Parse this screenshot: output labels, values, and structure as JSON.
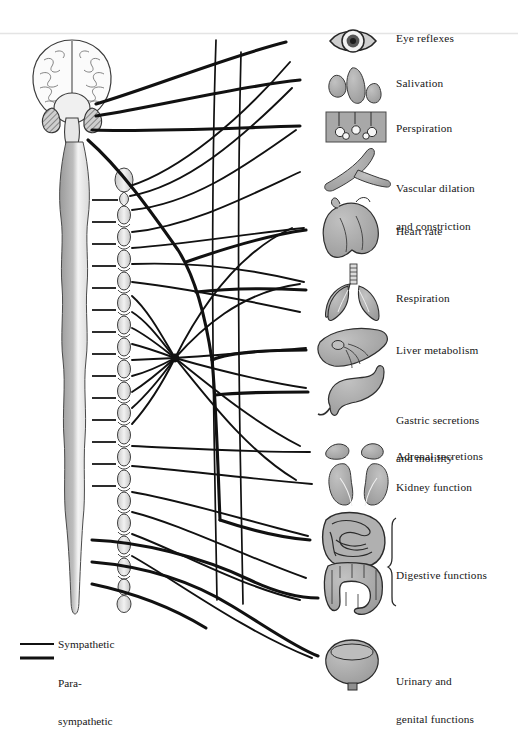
{
  "figure": {
    "type": "anatomical-diagram",
    "background_color": "#ffffff",
    "ink_color": "#1a1a1a",
    "organ_fill": "#a6a6a6",
    "top_rule_color": "#e2e2e2"
  },
  "labels": [
    {
      "id": "eye",
      "text": "Eye reflexes",
      "x": 396,
      "y": 32,
      "lines": [
        "Eye reflexes"
      ]
    },
    {
      "id": "saliva",
      "text": "Salivation",
      "x": 396,
      "y": 77,
      "lines": [
        "Salivation"
      ]
    },
    {
      "id": "perspire",
      "text": "Perspiration",
      "x": 396,
      "y": 122,
      "lines": [
        "Perspiration"
      ]
    },
    {
      "id": "vascular",
      "text": "Vascular dilation and constriction",
      "x": 396,
      "y": 157,
      "lines": [
        "Vascular dilation",
        "and constriction"
      ]
    },
    {
      "id": "heart",
      "text": "Heart rate",
      "x": 396,
      "y": 225,
      "lines": [
        "Heart rate"
      ]
    },
    {
      "id": "respire",
      "text": "Respiration",
      "x": 396,
      "y": 292,
      "lines": [
        "Respiration"
      ]
    },
    {
      "id": "liver",
      "text": "Liver metabolism",
      "x": 396,
      "y": 344,
      "lines": [
        "Liver metabolism"
      ]
    },
    {
      "id": "gastric",
      "text": "Gastric secretions and motility",
      "x": 396,
      "y": 389,
      "lines": [
        "Gastric secretions",
        "and motility"
      ]
    },
    {
      "id": "adrenal",
      "text": "Adrenal secretions",
      "x": 396,
      "y": 450,
      "lines": [
        "Adrenal secretions"
      ]
    },
    {
      "id": "kidney",
      "text": "Kidney function",
      "x": 396,
      "y": 481,
      "lines": [
        "Kidney function"
      ]
    },
    {
      "id": "digestive",
      "text": "Digestive functions",
      "x": 396,
      "y": 569,
      "lines": [
        "Digestive functions"
      ]
    },
    {
      "id": "urinary",
      "text": "Urinary and genital functions",
      "x": 396,
      "y": 650,
      "lines": [
        "Urinary and",
        "genital functions"
      ]
    }
  ],
  "legend": {
    "items": [
      {
        "id": "sympathetic",
        "label": "Sympathetic",
        "lines": [
          "Sympathetic"
        ],
        "stroke_width": 2.0,
        "x": 58,
        "y": 643
      },
      {
        "id": "parasympathetic",
        "label": "Para- sympathetic",
        "lines": [
          "Para-",
          "sympathetic"
        ],
        "stroke_width": 3.2,
        "x": 58,
        "y": 657
      }
    ]
  },
  "organs": [
    {
      "id": "eye-icon",
      "name": "eye",
      "cx": 352,
      "cy": 41
    },
    {
      "id": "salivary-glands-icon",
      "name": "salivary glands",
      "cx": 355,
      "cy": 84
    },
    {
      "id": "skin-sweat-icon",
      "name": "skin sweat glands",
      "cx": 355,
      "cy": 127
    },
    {
      "id": "blood-vessel-icon",
      "name": "blood vessel",
      "cx": 352,
      "cy": 172
    },
    {
      "id": "heart-icon",
      "name": "heart",
      "cx": 352,
      "cy": 228
    },
    {
      "id": "lungs-icon",
      "name": "lungs",
      "cx": 352,
      "cy": 290
    },
    {
      "id": "liver-icon",
      "name": "liver",
      "cx": 352,
      "cy": 350
    },
    {
      "id": "stomach-icon",
      "name": "stomach",
      "cx": 355,
      "cy": 394
    },
    {
      "id": "adrenal-icon",
      "name": "adrenal glands",
      "cx": 352,
      "cy": 452
    },
    {
      "id": "kidneys-icon",
      "name": "kidneys",
      "cx": 352,
      "cy": 485
    },
    {
      "id": "small-intestine-icon",
      "name": "small intestine",
      "cx": 355,
      "cy": 540
    },
    {
      "id": "large-intestine-icon",
      "name": "large intestine",
      "cx": 355,
      "cy": 588
    },
    {
      "id": "bladder-icon",
      "name": "urinary bladder",
      "cx": 352,
      "cy": 660
    }
  ],
  "anatomy": {
    "brain": {
      "label": "brain",
      "cx": 72,
      "cy": 78
    },
    "spinal_cord": {
      "label": "spinal cord",
      "x": 72,
      "y_top": 140,
      "y_bottom": 610
    },
    "sympathetic_chain": {
      "label": "sympathetic chain ganglia",
      "x": 124,
      "y_top": 170,
      "y_bottom": 615
    },
    "celiac_ganglion": {
      "label": "celiac ganglion",
      "cx": 175,
      "cy": 358
    }
  },
  "bracket": {
    "id": "digestive-bracket",
    "x": 392,
    "y_top": 518,
    "y_bottom": 606
  }
}
